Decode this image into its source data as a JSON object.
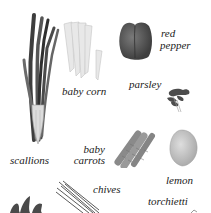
{
  "items": [
    {
      "id": "scallions",
      "label": "scallions"
    },
    {
      "id": "baby-corn",
      "label": "baby corn"
    },
    {
      "id": "red-pepper",
      "label_line1": "red",
      "label_line2": "pepper"
    },
    {
      "id": "parsley",
      "label": "parsley"
    },
    {
      "id": "baby-carrots",
      "label_line1": "baby",
      "label_line2": "carrots"
    },
    {
      "id": "lemon",
      "label": "lemon"
    },
    {
      "id": "chives",
      "label": "chives"
    },
    {
      "id": "torchietti",
      "label": "torchietti"
    }
  ],
  "colors": {
    "background": "#ffffff",
    "text": "#1a1a1a",
    "dark_green_gray": "#4a4a4a",
    "light_gray": "#d8d8d8",
    "pepper": "#5a5a5a",
    "carrot": "#8c8c8c",
    "lemon": "#bdbdbd"
  }
}
